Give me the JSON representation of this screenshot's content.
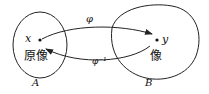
{
  "diagram": {
    "type": "mapping",
    "sets": [
      {
        "id": "A",
        "label": "A",
        "element": "x",
        "element_caption": "原像"
      },
      {
        "id": "B",
        "label": "B",
        "element": "y",
        "element_caption": "像"
      }
    ],
    "arrows": [
      {
        "from": "x",
        "to": "y",
        "label": "φ"
      },
      {
        "from": "y",
        "to": "x",
        "label": "φ⁻¹"
      }
    ]
  },
  "labels": {
    "x": "x",
    "y": "y",
    "preimage": "原像",
    "image": "像",
    "phi": "φ",
    "phi_inv": "φ⁻¹",
    "set_a": "A",
    "set_b": "B"
  },
  "colors": {
    "stroke": "#222222",
    "background": "#ffffff"
  }
}
